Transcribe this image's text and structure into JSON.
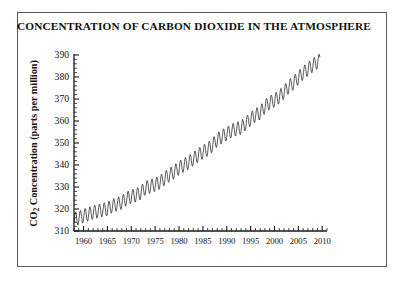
{
  "figure": {
    "title": "CONCENTRATION OF CARBON DIOXIDE IN THE ATMOSPHERE",
    "credit": "NOAA Climate Monitoring and Diagnostic Laboratory",
    "ylabel_prefix": "CO",
    "ylabel_subscript": "2",
    "ylabel_suffix": " Concentration (parts per million)",
    "frame_color": "#5a5a5a",
    "curve_color": "#1a1a1a",
    "background_color": "#ffffff"
  },
  "chart_data": {
    "type": "line",
    "title": "CONCENTRATION OF CARBON DIOXIDE IN THE ATMOSPHERE",
    "subtitle": "",
    "xlabel": "",
    "ylabel": "CO2 Concentration (parts per million)",
    "xlim": [
      1958,
      2011
    ],
    "ylim": [
      310,
      390
    ],
    "grid": false,
    "legend": "none",
    "x_ticks": [
      1960,
      1965,
      1970,
      1975,
      1980,
      1985,
      1990,
      1995,
      2000,
      2005,
      2010
    ],
    "x_tick_labels": [
      "1960",
      "1965",
      "1970",
      "1975",
      "1980",
      "1985",
      "1990",
      "1995",
      "2000",
      "2005",
      "2010"
    ],
    "x_minor_tick_step": 1,
    "y_ticks": [
      310,
      320,
      330,
      340,
      350,
      360,
      370,
      380,
      390
    ],
    "y_tick_labels": [
      "310",
      "320",
      "330",
      "340",
      "350",
      "360",
      "370",
      "380",
      "390"
    ],
    "y_minor_tick_step": 2,
    "series": [
      {
        "name": "Mauna Loa monthly mean CO2",
        "annual_amplitude_ppm": 6.2,
        "seasonal_peak_month": 5,
        "seasonal_trough_month": 10,
        "x": [
          1958,
          1959,
          1960,
          1961,
          1962,
          1963,
          1964,
          1965,
          1966,
          1967,
          1968,
          1969,
          1970,
          1971,
          1972,
          1973,
          1974,
          1975,
          1976,
          1977,
          1978,
          1979,
          1980,
          1981,
          1982,
          1983,
          1984,
          1985,
          1986,
          1987,
          1988,
          1989,
          1990,
          1991,
          1992,
          1993,
          1994,
          1995,
          1996,
          1997,
          1998,
          1999,
          2000,
          2001,
          2002,
          2003,
          2004,
          2005,
          2006,
          2007,
          2008,
          2009
        ],
        "values": [
          315.3,
          315.98,
          316.91,
          317.64,
          318.45,
          318.99,
          319.62,
          320.04,
          321.38,
          322.16,
          323.04,
          324.62,
          325.68,
          326.32,
          327.45,
          329.68,
          330.25,
          331.15,
          332.15,
          333.9,
          335.5,
          336.85,
          338.69,
          339.93,
          341.13,
          342.78,
          344.42,
          345.9,
          347.15,
          348.93,
          351.48,
          352.91,
          354.19,
          355.59,
          356.37,
          357.04,
          358.89,
          360.88,
          362.64,
          363.76,
          366.63,
          368.31,
          369.48,
          371.02,
          373.1,
          375.64,
          377.38,
          379.67,
          381.84,
          383.55,
          385.34,
          386.8
        ]
      }
    ]
  },
  "axes": {
    "y_axis_name": "y-axis",
    "x_axis_name": "x-axis"
  }
}
